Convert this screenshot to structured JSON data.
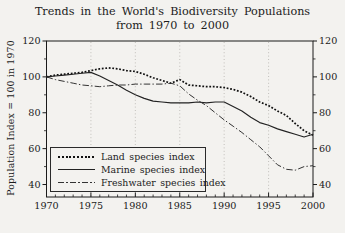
{
  "title": {
    "line1": "Trends in the World's Biodiversity Populations",
    "line2": "from 1970 to 2000"
  },
  "ylabel": "Population Index = 100 in 1970",
  "legend": [
    {
      "label": "Land species index",
      "style": "dotted"
    },
    {
      "label": "Marine species index",
      "style": "solid"
    },
    {
      "label": "Freshwater species index",
      "style": "dashdot"
    }
  ],
  "colors": {
    "background": "#f3f2ef",
    "axis": "#1a1a1a",
    "grid": "#b5b3ad",
    "land_line": "#111111",
    "marine_line": "#222222",
    "freshwater_line": "#333333"
  },
  "chart_data": {
    "type": "line",
    "title": "Trends in the World's Biodiversity Populations from 1970 to 2000",
    "xlabel": "",
    "ylabel": "Population Index = 100 in 1970",
    "xlim": [
      1970,
      2000
    ],
    "ylim": [
      40,
      120
    ],
    "xticks": [
      1970,
      1975,
      1980,
      1985,
      1990,
      1995,
      2000
    ],
    "yticks": [
      40,
      60,
      80,
      100,
      120
    ],
    "minor_yticks": [
      50,
      70,
      90,
      110
    ],
    "grid": "vertical dotted gridlines at 1975-1995, both y axes labeled",
    "legend_position": "lower-left",
    "x": [
      1970,
      1971,
      1972,
      1973,
      1974,
      1975,
      1976,
      1977,
      1978,
      1979,
      1980,
      1981,
      1982,
      1983,
      1984,
      1985,
      1986,
      1987,
      1988,
      1989,
      1990,
      1991,
      1992,
      1993,
      1994,
      1995,
      1996,
      1997,
      1998,
      1999,
      2000
    ],
    "series": [
      {
        "name": "Land species index",
        "style": "dotted",
        "values": [
          100,
          101,
          101.5,
          102,
          102.5,
          103.5,
          104.5,
          105,
          104.5,
          103.5,
          103,
          101.5,
          99.5,
          98,
          96.5,
          98.5,
          95.5,
          95,
          94.5,
          94.5,
          94,
          93,
          91.5,
          89,
          86,
          84,
          81,
          78.5,
          74,
          70,
          67.5
        ]
      },
      {
        "name": "Marine species index",
        "style": "solid",
        "values": [
          100,
          100.5,
          101,
          101.5,
          102,
          102.5,
          100.5,
          98,
          95.5,
          92.5,
          90,
          88,
          86.5,
          86,
          85.5,
          85.5,
          85.5,
          86,
          85.5,
          86,
          86,
          83.5,
          81,
          77.5,
          74.5,
          73,
          71,
          69.5,
          68,
          66.5,
          68
        ]
      },
      {
        "name": "Freshwater species index",
        "style": "dashdot",
        "values": [
          100,
          98.5,
          97.5,
          96.5,
          95.5,
          95,
          94.5,
          95,
          95.5,
          95.5,
          96,
          96,
          96,
          96,
          96.5,
          95,
          90.5,
          87,
          84,
          80,
          76,
          72.5,
          69,
          65,
          61,
          56,
          51,
          48.5,
          48,
          50,
          50.5
        ]
      }
    ]
  }
}
